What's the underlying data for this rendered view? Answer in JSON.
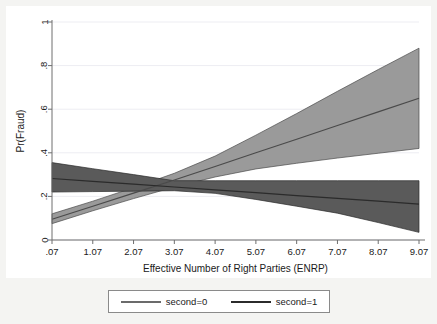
{
  "chart_data": {
    "type": "line",
    "title": "",
    "xlabel": "Effective Number of Right Parties (ENRP)",
    "ylabel": "Pr(Fraud)",
    "xlim": [
      0.07,
      9.07
    ],
    "ylim": [
      0,
      1
    ],
    "grid": true,
    "grid_axis": "y",
    "legend_position": "bottom-outside",
    "xticks": [
      ".07",
      "1.07",
      "2.07",
      "3.07",
      "4.07",
      "5.07",
      "6.07",
      "7.07",
      "8.07",
      "9.07"
    ],
    "xtick_values": [
      0.07,
      1.07,
      2.07,
      3.07,
      4.07,
      5.07,
      6.07,
      7.07,
      8.07,
      9.07
    ],
    "yticks": [
      "0",
      ".2",
      ".4",
      ".6",
      ".8",
      "1"
    ],
    "ytick_values": [
      0,
      0.2,
      0.4,
      0.6,
      0.8,
      1
    ],
    "x": [
      0.07,
      1.07,
      2.07,
      3.07,
      4.07,
      5.07,
      6.07,
      7.07,
      8.07,
      9.07
    ],
    "series": [
      {
        "name": "second=0",
        "color": "#9a9a9a",
        "line_color": "#4a4a4a",
        "values": [
          0.095,
          0.155,
          0.215,
          0.275,
          0.337,
          0.4,
          0.462,
          0.525,
          0.588,
          0.65
        ],
        "ci_lower": [
          0.075,
          0.134,
          0.19,
          0.243,
          0.289,
          0.326,
          0.352,
          0.376,
          0.398,
          0.42
        ],
        "ci_upper": [
          0.12,
          0.178,
          0.24,
          0.306,
          0.385,
          0.481,
          0.58,
          0.682,
          0.782,
          0.88
        ]
      },
      {
        "name": "second=1",
        "color": "#5a5a5a",
        "line_color": "#2b2b2b",
        "values": [
          0.282,
          0.269,
          0.256,
          0.243,
          0.23,
          0.217,
          0.204,
          0.191,
          0.178,
          0.165
        ],
        "ci_lower": [
          0.22,
          0.222,
          0.224,
          0.226,
          0.214,
          0.186,
          0.155,
          0.123,
          0.08,
          0.035
        ],
        "ci_upper": [
          0.355,
          0.327,
          0.3,
          0.272,
          0.272,
          0.272,
          0.272,
          0.272,
          0.272,
          0.272
        ]
      }
    ]
  },
  "legend": {
    "entries": [
      {
        "label": "second=0",
        "color": "#6b6b6b"
      },
      {
        "label": "second=1",
        "color": "#2b2b2b"
      }
    ]
  }
}
